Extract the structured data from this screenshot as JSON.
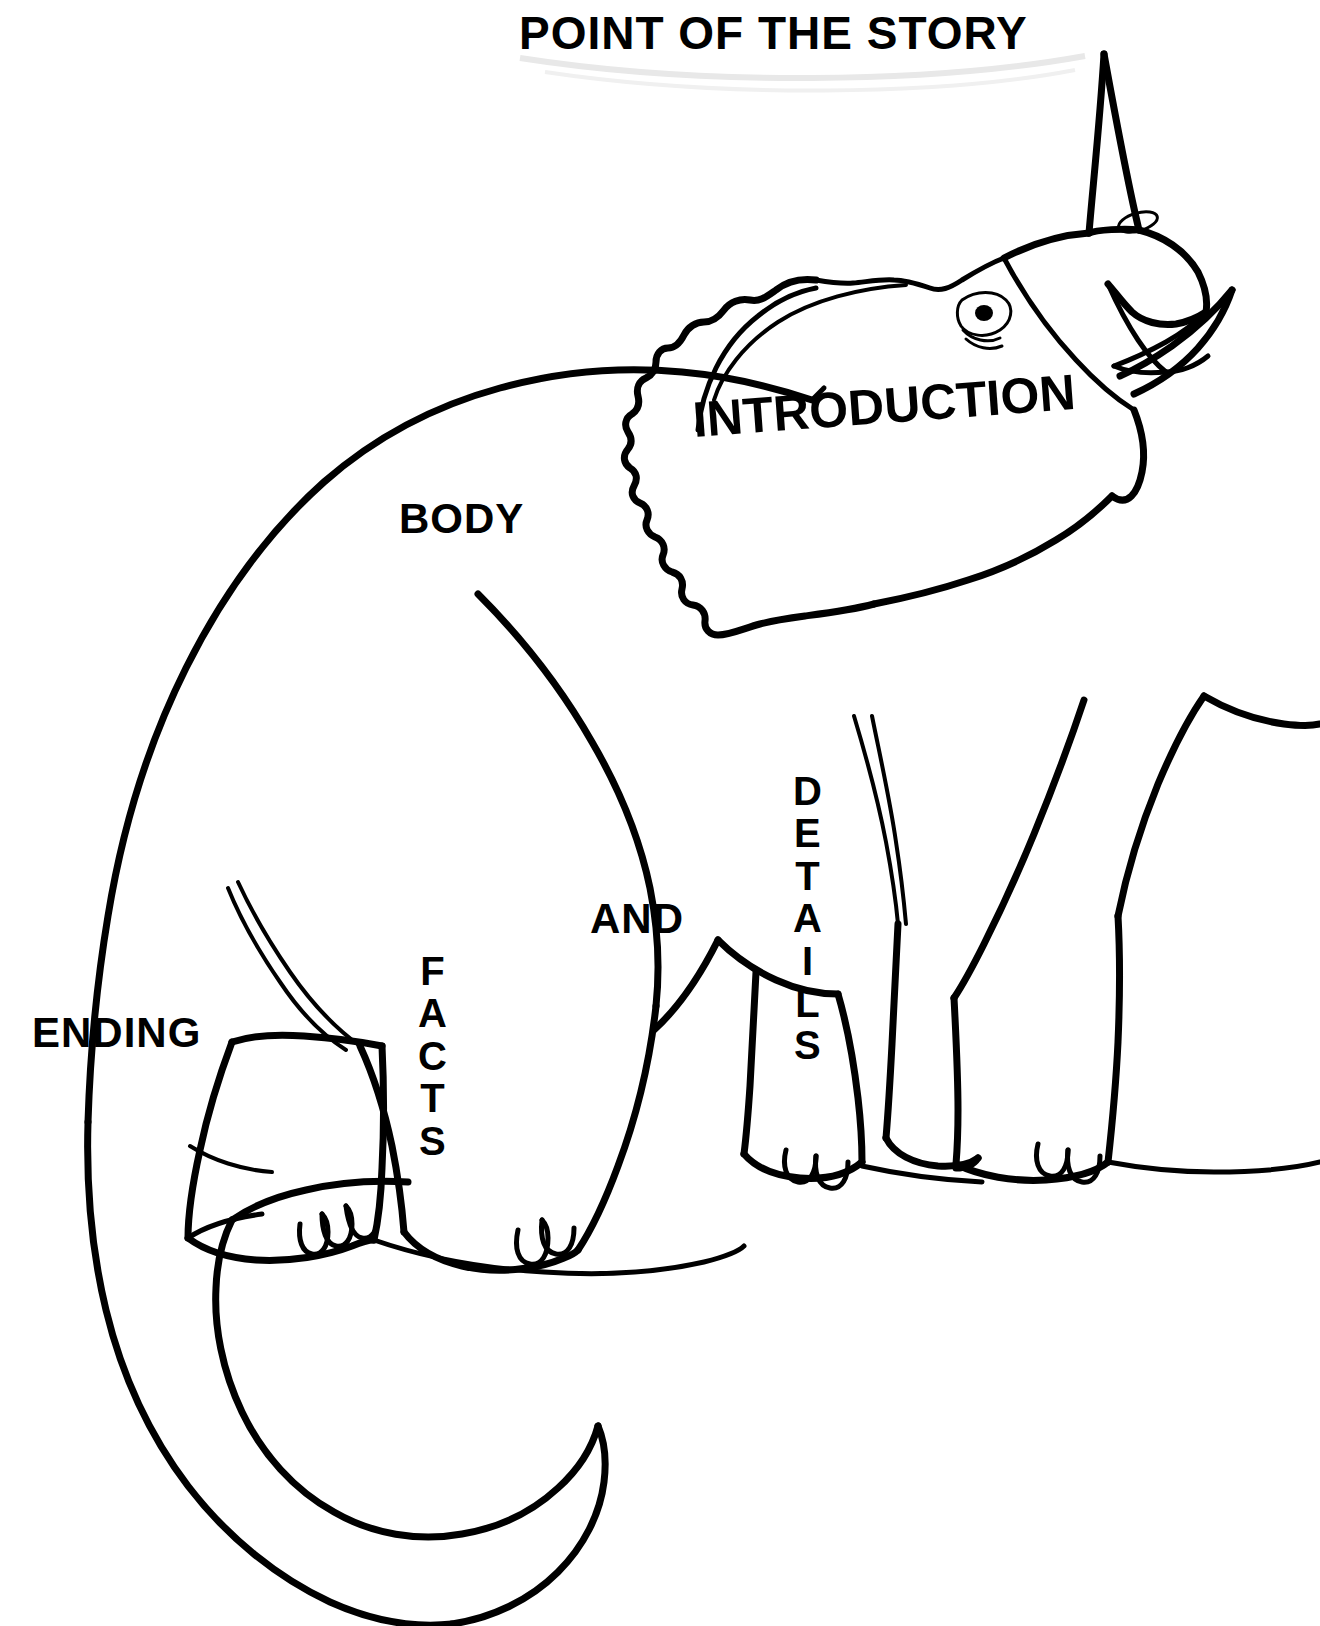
{
  "document": {
    "type": "educational-diagram",
    "subject": "story-structure-dinosaur",
    "title": "POINT OF THE STORY"
  },
  "labels": {
    "title": "POINT OF THE STORY",
    "introduction": "INTRODUCTION",
    "body": "BODY",
    "and": "AND",
    "ending": "ENDING",
    "details_letters": [
      "D",
      "E",
      "T",
      "A",
      "I",
      "L",
      "S"
    ],
    "details_word": "DETAILS",
    "facts_letters": [
      "F",
      "A",
      "C",
      "T",
      "S"
    ],
    "facts_word": "FACTS"
  },
  "illustration": {
    "name": "horned-dinosaur-ceratopsian",
    "description": "Line drawing of a horned ceratopsian dinosaur with a scalloped neck frill, nose horn, open beak, standing on a ground line, with a long curving tail",
    "parts": [
      "nose-horn",
      "neck-frill",
      "eye",
      "nostril",
      "open-beak",
      "front-legs",
      "hind-legs",
      "tail",
      "ground-line"
    ]
  },
  "colors": {
    "ink": "#000000",
    "background": "#ffffff"
  }
}
